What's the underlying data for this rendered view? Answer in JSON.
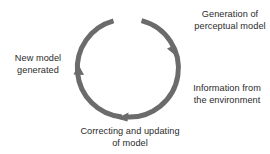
{
  "diagram": {
    "background_color": "#ffffff",
    "arrow_color": "#6b6b6b",
    "text_color": "#2b2b2b",
    "cycle": {
      "direction": "clockwise",
      "center_x": 127,
      "center_y": 68,
      "radius": 49,
      "stroke_width": 5,
      "gap_top_degrees": 22
    },
    "labels": {
      "generation": "Generation of\nperceptual model",
      "information": "Information from\nthe environment",
      "correcting": "Correcting and updating\nof model",
      "new_model": "New model\ngenerated"
    },
    "arrowheads": [
      {
        "name": "arrowhead-right",
        "x": 173,
        "y": 50,
        "points": "down-right"
      },
      {
        "name": "arrowhead-bottom",
        "x": 122,
        "y": 117,
        "points": "left"
      },
      {
        "name": "arrowhead-left",
        "x": 79,
        "y": 72,
        "points": "up"
      }
    ]
  }
}
